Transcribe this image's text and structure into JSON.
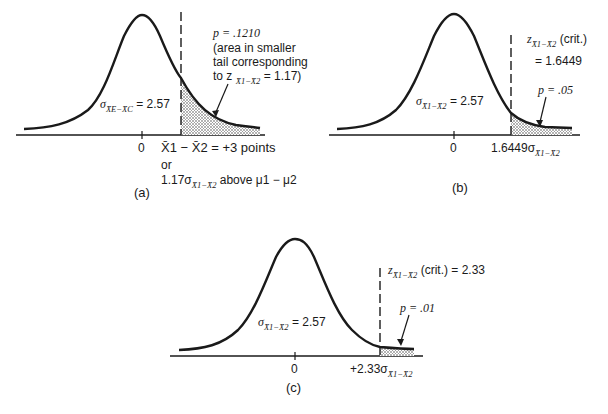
{
  "panels": [
    {
      "id": "a",
      "caption": "(a)",
      "zero_label": "0",
      "sigma_label": "σ",
      "sigma_sub": "X̄E−X̄C",
      "sigma_value": "= 2.57",
      "p_label": "p = .1210",
      "p_note_lines": [
        "(area in smaller",
        "tail corresponding",
        "to z"
      ],
      "p_note_sub": "X̄1−X̄2",
      "p_note_tail": "= 1.17)",
      "x_label_line1": "X̄1 − X̄2 = +3 points",
      "x_label_line2": "or",
      "x_label_line3_prefix": "1.17σ",
      "x_label_line3_sub": "X̄1−X̄2",
      "x_label_line3_suffix": "above μ1 − μ2"
    },
    {
      "id": "b",
      "caption": "(b)",
      "zero_label": "0",
      "sigma_label": "σ",
      "sigma_sub": "X̄1−X̄2",
      "sigma_value": "= 2.57",
      "crit_prefix": "z",
      "crit_sub": "X̄1−X̄2",
      "crit_suffix": "(crit.)",
      "crit_value": "= 1.6449",
      "p_label": "p = .05",
      "x_label_prefix": "1.6449σ",
      "x_label_sub": "X̄1−X̄2"
    },
    {
      "id": "c",
      "caption": "(c)",
      "zero_label": "0",
      "sigma_label": "σ",
      "sigma_sub": "X̄1−X̄2",
      "sigma_value": "= 2.57",
      "crit_prefix": "z",
      "crit_sub": "X̄1−X̄2",
      "crit_suffix": "(crit.) = 2.33",
      "p_label": "p = .01",
      "x_label_prefix": "+2.33σ",
      "x_label_sub": "X̄1−X̄2"
    }
  ],
  "colors": {
    "ink": "#1a1a1a",
    "shade": "#9a9a9a"
  }
}
